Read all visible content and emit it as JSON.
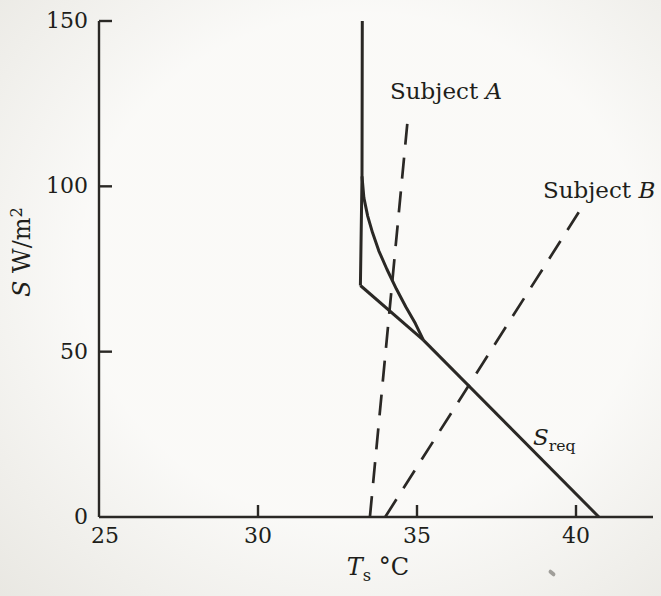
{
  "figure": {
    "bg_color": "#f5f4f0",
    "ink_color": "#2a2825",
    "text_color": "#201e1a"
  },
  "chart_data": {
    "type": "line",
    "title": "",
    "xlabel": "Ts °C",
    "ylabel": "S W/m2",
    "xlabel_parts": [
      {
        "t": "T",
        "style": "italic"
      },
      {
        "t": "s",
        "style": "sub"
      },
      {
        "t": " °C",
        "style": "plain"
      }
    ],
    "ylabel_parts": [
      {
        "t": "S",
        "style": "italic"
      },
      {
        "t": " W/m",
        "style": "plain"
      },
      {
        "t": "2",
        "style": "sup"
      }
    ],
    "xlim": [
      25,
      42.4
    ],
    "ylim": [
      0,
      150
    ],
    "x_ticks": [
      25,
      30,
      35,
      40
    ],
    "x_tick_labels": [
      "25",
      "30",
      "35",
      "40"
    ],
    "y_ticks": [
      0,
      50,
      100,
      150
    ],
    "y_tick_labels": [
      "0",
      "50",
      "100",
      "150"
    ],
    "grid": false,
    "legend_position": "none",
    "series": [
      {
        "name": "sreq-vertical-asymptote",
        "style": "solid",
        "points": [
          [
            33.28,
            150
          ],
          [
            33.27,
            103
          ],
          [
            33.22,
            70
          ]
        ]
      },
      {
        "name": "sreq-curve",
        "style": "solid",
        "points": [
          [
            33.27,
            103
          ],
          [
            33.33,
            96.5
          ],
          [
            33.45,
            91
          ],
          [
            33.6,
            86
          ],
          [
            33.8,
            80.5
          ],
          [
            34.05,
            75
          ],
          [
            34.35,
            69
          ],
          [
            34.65,
            63.5
          ],
          [
            34.95,
            58.5
          ],
          [
            35.2,
            53.5
          ]
        ]
      },
      {
        "name": "sreq-chord",
        "style": "solid",
        "points": [
          [
            33.22,
            70
          ],
          [
            35.2,
            53.5
          ]
        ]
      },
      {
        "name": "sreq-line",
        "style": "solid",
        "points": [
          [
            35.2,
            53.5
          ],
          [
            40.72,
            0
          ]
        ]
      },
      {
        "name": "subject-a-line",
        "style": "dashed",
        "points": [
          [
            33.52,
            0
          ],
          [
            34.72,
            121.5
          ]
        ]
      },
      {
        "name": "subject-b-line",
        "style": "dashed",
        "points": [
          [
            34.0,
            0
          ],
          [
            40.13,
            92.8
          ]
        ]
      }
    ],
    "annotations": [
      {
        "name": "subject-a-label",
        "text": "Subject A",
        "T": 34.15,
        "S": 126.5,
        "anchor": "start",
        "parts": [
          {
            "t": "Subject ",
            "style": "plain"
          },
          {
            "t": "A",
            "style": "italic"
          }
        ]
      },
      {
        "name": "subject-b-label",
        "text": "Subject B",
        "T": 38.96,
        "S": 96.5,
        "anchor": "start",
        "parts": [
          {
            "t": "Subject ",
            "style": "plain"
          },
          {
            "t": "B",
            "style": "italic"
          }
        ]
      },
      {
        "name": "sreq-label",
        "text": "Sreq",
        "T": 38.65,
        "S": 21.8,
        "anchor": "start",
        "parts": [
          {
            "t": "S",
            "style": "italic"
          },
          {
            "t": "req",
            "style": "sub"
          }
        ]
      }
    ]
  }
}
